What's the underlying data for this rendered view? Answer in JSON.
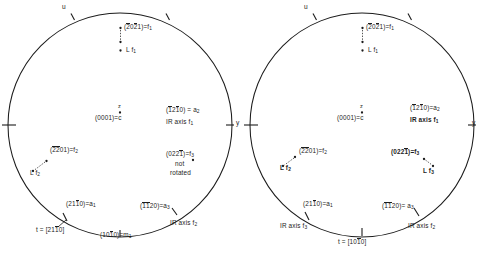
{
  "figure": {
    "type": "stereographic-projection-pair",
    "panels": [
      {
        "id": "left",
        "cx": 120,
        "cy": 125,
        "r": 112,
        "axis_marks": [
          {
            "name": "u-axis-label",
            "text": "u",
            "x": 62,
            "y": 5
          },
          {
            "name": "y-axis-label",
            "text": "y",
            "x": 236,
            "y": 122
          },
          {
            "name": "z-axis-label",
            "text": "z",
            "x": 118,
            "y": 104
          }
        ],
        "labels": [
          {
            "name": "pole-f1",
            "lines": [
              "(2̂0̂2̂1)=f₁"
            ],
            "x": 124,
            "y": 24,
            "bold": false,
            "m_line": "(2021)=f1",
            "indices": [
              2,
              0,
              2,
              1
            ],
            "bars": [
              true,
              false,
              true,
              false
            ],
            "sym": "f",
            "subscript": "1"
          },
          {
            "name": "pole-L-f1",
            "lines": [
              "L f₁"
            ],
            "x": 124,
            "y": 53,
            "bold": false,
            "sym": "L f",
            "subscript": "1"
          },
          {
            "name": "pole-c",
            "lines": [
              "(0001)=c"
            ],
            "x": 95,
            "y": 116,
            "bold": false,
            "sym": "c"
          },
          {
            "name": "pole-a2",
            "lines": [
              "(1̂21̂0)=a₂",
              "IR axis f₁"
            ],
            "x": 166,
            "y": 108,
            "bold": false
          },
          {
            "name": "pole-f3-notrot",
            "lines": [
              "(022̂1)=f₃",
              "not",
              "rotated"
            ],
            "x": 166,
            "y": 152,
            "bold": false
          },
          {
            "name": "pole-f2",
            "lines": [
              "(2̂2̂01)=f₂"
            ],
            "x": 42,
            "y": 146,
            "bold": false
          },
          {
            "name": "pole-L-f2",
            "lines": [
              "L f₂"
            ],
            "x": 28,
            "y": 170,
            "bold": false
          },
          {
            "name": "pole-a1",
            "lines": [
              "(21̂1̂0)=a₁"
            ],
            "x": 62,
            "y": 202,
            "bold": false
          },
          {
            "name": "trace-t",
            "lines": [
              "t = [21̂1̂0]"
            ],
            "x": 38,
            "y": 228,
            "bold": false
          },
          {
            "name": "pole-m1",
            "lines": [
              "(101̂0)=m₁"
            ],
            "x": 100,
            "y": 232,
            "bold": false
          },
          {
            "name": "pole-a3",
            "lines": [
              "(1̂1̂20)=a₃"
            ],
            "x": 140,
            "y": 204,
            "bold": false
          },
          {
            "name": "ir-axis-f2",
            "lines": [
              "IR axis f₂"
            ],
            "x": 168,
            "y": 222,
            "bold": false
          }
        ]
      },
      {
        "id": "right",
        "cx": 362,
        "cy": 125,
        "r": 112,
        "axis_marks": [
          {
            "name": "u-axis-label",
            "text": "u",
            "x": 303,
            "y": 5
          },
          {
            "name": "y-axis-label",
            "text": "y",
            "x": 478,
            "y": 122
          },
          {
            "name": "z-axis-label",
            "text": "z",
            "x": 360,
            "y": 104
          }
        ],
        "labels": [
          {
            "name": "pole-f1",
            "lines": [
              "(2̂0̂2̂1)=f₁"
            ],
            "x": 366,
            "y": 24,
            "bold": false
          },
          {
            "name": "pole-L-f1",
            "lines": [
              "L f₁"
            ],
            "x": 366,
            "y": 53,
            "bold": false
          },
          {
            "name": "pole-c",
            "lines": [
              "(0001)=c"
            ],
            "x": 337,
            "y": 116,
            "bold": false
          },
          {
            "name": "pole-a2",
            "lines": [
              "(1̂21̂0)=a₂"
            ],
            "x": 412,
            "y": 108,
            "bold": false
          },
          {
            "name": "ir-axis-f1",
            "lines": [
              "IR axis f₁"
            ],
            "x": 412,
            "y": 117,
            "bold": true
          },
          {
            "name": "pole-f2",
            "lines": [
              "(2̂2̂01)=f₂"
            ],
            "x": 292,
            "y": 152,
            "bold": false
          },
          {
            "name": "pole-L-f2",
            "lines": [
              "L f₂"
            ],
            "x": 278,
            "y": 166,
            "bold": true
          },
          {
            "name": "pole-f3",
            "lines": [
              "(022̂1)=f₃"
            ],
            "x": 398,
            "y": 150,
            "bold": true
          },
          {
            "name": "pole-L-f3",
            "lines": [
              "L f₃"
            ],
            "x": 420,
            "y": 169,
            "bold": true
          },
          {
            "name": "pole-a1",
            "lines": [
              "(21̂1̂0)=a₁"
            ],
            "x": 303,
            "y": 202,
            "bold": false
          },
          {
            "name": "ir-axis-f3",
            "lines": [
              "IR axis f₃"
            ],
            "x": 285,
            "y": 224,
            "bold": false
          },
          {
            "name": "trace-t",
            "lines": [
              "t = [101̂0]"
            ],
            "x": 350,
            "y": 235,
            "bold": false
          },
          {
            "name": "pole-a3",
            "lines": [
              "(1̂1̂20)= a₃"
            ],
            "x": 382,
            "y": 204,
            "bold": false
          },
          {
            "name": "ir-axis-f2",
            "lines": [
              "IR axis f₂"
            ],
            "x": 410,
            "y": 224,
            "bold": false
          }
        ]
      }
    ],
    "text": {
      "u": "u",
      "y": "y",
      "z": "z",
      "c_pole": "(0001)=c",
      "f1_pole": "(2̂0̂2̂1)=f₁",
      "L_f1": "L f₁",
      "L_f2": "L f₂",
      "L_f3": "L f₃",
      "a2_pole": "(1̂21̂0)=a₂",
      "a1_pole": "(21̂1̂0)=a₁",
      "a3_pole": "(1̂1̂20)=a₃",
      "f2_pole": "(2̂2̂01)=f₂",
      "f3_pole": "(022̂1)=f₃",
      "m1_pole": "(101̂0)=m₁",
      "ir_axis_f1": "IR axis f₁",
      "ir_axis_f2": "IR axis f₂",
      "ir_axis_f3": "IR axis f₃",
      "not_rotated_1": "not",
      "not_rotated_2": "rotated",
      "t_left": "t = [21̂1̂0]",
      "t_right": "t = [101̂0]"
    },
    "colors": {
      "line": "#1c1c1c",
      "background": "#ffffff",
      "text": "#1c1c1c"
    }
  }
}
